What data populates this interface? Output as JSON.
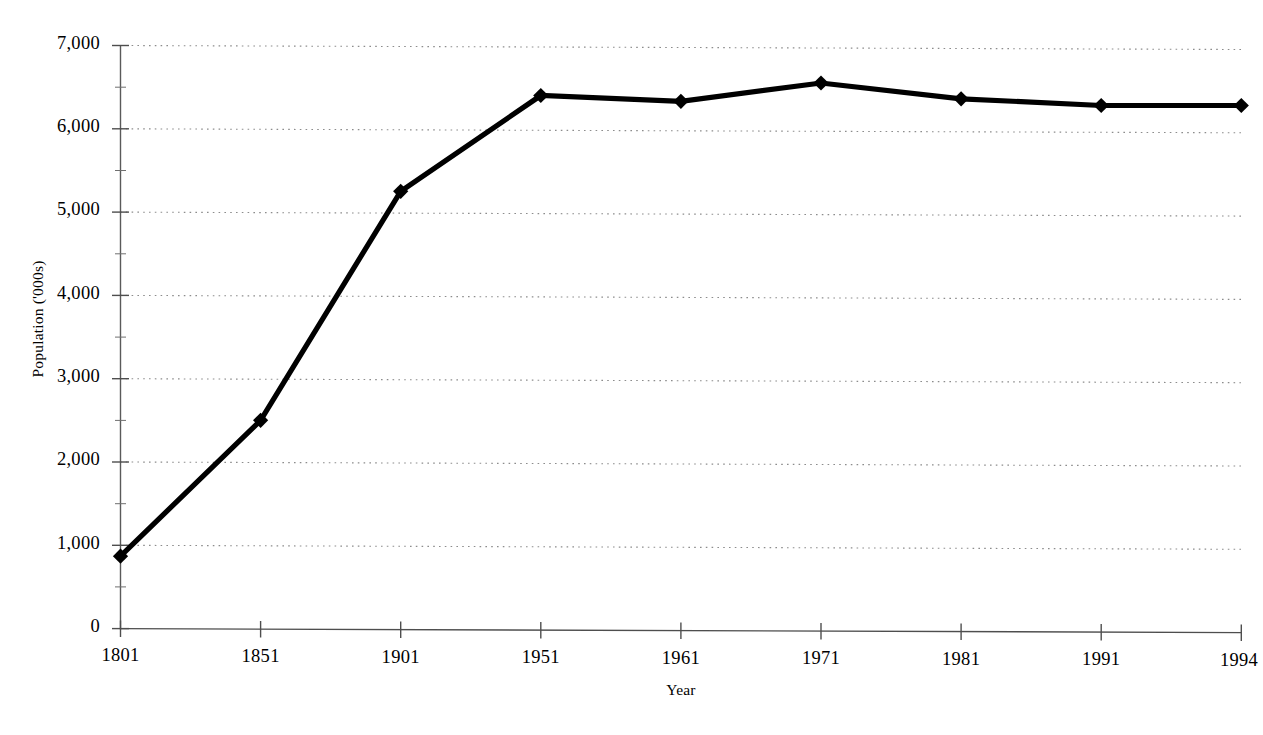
{
  "chart_data": {
    "type": "line",
    "title": "",
    "xlabel": "Year",
    "ylabel": "Population ('000s)",
    "categories": [
      "1801",
      "1851",
      "1901",
      "1951",
      "1961",
      "1971",
      "1981",
      "1991",
      "1994"
    ],
    "values": [
      870,
      2500,
      5250,
      6400,
      6330,
      6550,
      6360,
      6280,
      6280
    ],
    "series": [
      {
        "name": "Population",
        "values": [
          870,
          2500,
          5250,
          6400,
          6330,
          6550,
          6360,
          6280,
          6280
        ]
      }
    ],
    "ylim": [
      0,
      7000
    ],
    "ytick_values": [
      0,
      1000,
      2000,
      3000,
      4000,
      5000,
      6000,
      7000
    ],
    "ytick_labels": [
      "0",
      "1,000",
      "2,000",
      "3,000",
      "4,000",
      "5,000",
      "6,000",
      "7,000"
    ],
    "grid": "horizontal-dotted",
    "legend": "none",
    "marker": "diamond",
    "line_color": "#000000",
    "grid_color": "#8c8c8c",
    "axis_color": "#5a5a5a",
    "background": "#ffffff"
  },
  "axis": {
    "y_title": "Population ('000s)",
    "x_title": "Year"
  }
}
